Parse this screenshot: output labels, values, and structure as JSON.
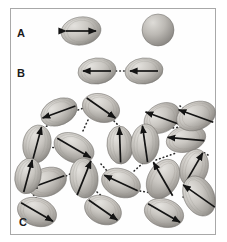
{
  "figure": {
    "type": "scientific-diagram",
    "background_color": "#ffffff",
    "frame_color": "#a8a8a8",
    "particle_fill_light": "#d8d6d2",
    "particle_fill_mid": "#b8b5b0",
    "particle_fill_dark": "#8e8b86",
    "arrow_color": "#1a1a1a",
    "dotted_link_color": "#2a2a2a"
  },
  "panels": [
    {
      "id": "A",
      "label": "A",
      "label_x": 17,
      "label_y": 28,
      "items": [
        {
          "name": "egg-particle-with-double-arrow",
          "cx": 81,
          "cy": 31,
          "rx": 20,
          "ry": 14,
          "rot": -8,
          "arrow": "double",
          "arrow_angle": 0,
          "arrow_len": 30
        },
        {
          "name": "plain-sphere",
          "cx": 158,
          "cy": 30,
          "r": 16,
          "arrow": "none"
        }
      ]
    },
    {
      "id": "B",
      "label": "B",
      "label_x": 17,
      "label_y": 68,
      "items": [
        {
          "name": "egg-particle-left-arrow-1",
          "cx": 97,
          "cy": 71,
          "rx": 19,
          "ry": 13,
          "rot": -6,
          "arrow": "single-left",
          "arrow_len": 28
        },
        {
          "name": "egg-particle-left-arrow-2",
          "cx": 144,
          "cy": 71,
          "rx": 19,
          "ry": 13,
          "rot": -6,
          "arrow": "single-left",
          "arrow_len": 28
        }
      ],
      "links": [
        {
          "x1": 116,
          "y1": 71,
          "x2": 125,
          "y2": 71,
          "dots": 3
        }
      ]
    },
    {
      "id": "C",
      "label": "C",
      "label_x": 19,
      "label_y": 224,
      "items": [
        {
          "name": "egg-particle",
          "cx": 59,
          "cy": 112,
          "rx": 19,
          "ry": 13,
          "rot": -24,
          "arrow_angle": 160
        },
        {
          "name": "egg-particle",
          "cx": 101,
          "cy": 108,
          "rx": 19,
          "ry": 14,
          "rot": 18,
          "arrow_angle": 35
        },
        {
          "name": "egg-particle",
          "cx": 162,
          "cy": 118,
          "rx": 19,
          "ry": 14,
          "rot": -30,
          "arrow_angle": 200
        },
        {
          "name": "egg-particle",
          "cx": 37,
          "cy": 144,
          "rx": 14,
          "ry": 19,
          "rot": 10,
          "arrow_angle": 285
        },
        {
          "name": "egg-particle",
          "cx": 74,
          "cy": 148,
          "rx": 21,
          "ry": 14,
          "rot": 25,
          "arrow_angle": 30
        },
        {
          "name": "egg-particle",
          "cx": 120,
          "cy": 145,
          "rx": 13,
          "ry": 19,
          "rot": -4,
          "arrow_angle": 268
        },
        {
          "name": "egg-particle",
          "cx": 145,
          "cy": 144,
          "rx": 14,
          "ry": 20,
          "rot": 4,
          "arrow_angle": 262
        },
        {
          "name": "egg-particle",
          "cx": 186,
          "cy": 139,
          "rx": 20,
          "ry": 13,
          "rot": -14,
          "arrow_angle": 185
        },
        {
          "name": "egg-particle",
          "cx": 84,
          "cy": 178,
          "rx": 14,
          "ry": 20,
          "rot": -6,
          "arrow_angle": 292
        },
        {
          "name": "egg-particle",
          "cx": 194,
          "cy": 168,
          "rx": 14,
          "ry": 19,
          "rot": 16,
          "arrow_angle": 300
        },
        {
          "name": "egg-particle",
          "cx": 47,
          "cy": 182,
          "rx": 20,
          "ry": 14,
          "rot": -20,
          "arrow_angle": 160
        },
        {
          "name": "egg-particle",
          "cx": 121,
          "cy": 183,
          "rx": 20,
          "ry": 14,
          "rot": 20,
          "arrow_angle": 205
        },
        {
          "name": "egg-particle",
          "cx": 163,
          "cy": 179,
          "rx": 15,
          "ry": 21,
          "rot": 30,
          "arrow_angle": 240
        },
        {
          "name": "egg-particle",
          "cx": 37,
          "cy": 212,
          "rx": 20,
          "ry": 14,
          "rot": 18,
          "arrow_angle": 30
        },
        {
          "name": "egg-particle",
          "cx": 103,
          "cy": 210,
          "rx": 19,
          "ry": 14,
          "rot": 22,
          "arrow_angle": 35
        },
        {
          "name": "egg-particle",
          "cx": 164,
          "cy": 213,
          "rx": 20,
          "ry": 14,
          "rot": 16,
          "arrow_angle": 30
        },
        {
          "name": "egg-particle",
          "cx": 199,
          "cy": 196,
          "rx": 15,
          "ry": 21,
          "rot": -26,
          "arrow_angle": 215
        },
        {
          "name": "egg-particle",
          "cx": 196,
          "cy": 116,
          "rx": 20,
          "ry": 14,
          "rot": -20,
          "arrow_angle": 200
        },
        {
          "name": "egg-particle",
          "cx": 28,
          "cy": 176,
          "rx": 13,
          "ry": 18,
          "rot": 12,
          "arrow_angle": 285
        }
      ],
      "links": [
        {
          "x1": 78,
          "y1": 110,
          "x2": 84,
          "y2": 108
        },
        {
          "x1": 47,
          "y1": 126,
          "x2": 39,
          "y2": 129
        },
        {
          "x1": 88,
          "y1": 120,
          "x2": 82,
          "y2": 133
        },
        {
          "x1": 114,
          "y1": 121,
          "x2": 122,
          "y2": 129
        },
        {
          "x1": 49,
          "y1": 147,
          "x2": 57,
          "y2": 148
        },
        {
          "x1": 133,
          "y1": 146,
          "x2": 140,
          "y2": 145
        },
        {
          "x1": 154,
          "y1": 131,
          "x2": 160,
          "y2": 126
        },
        {
          "x1": 173,
          "y1": 128,
          "x2": 180,
          "y2": 127
        },
        {
          "x1": 180,
          "y1": 106,
          "x2": 186,
          "y2": 110
        },
        {
          "x1": 143,
          "y1": 163,
          "x2": 133,
          "y2": 172
        },
        {
          "x1": 156,
          "y1": 160,
          "x2": 176,
          "y2": 153
        },
        {
          "x1": 85,
          "y1": 160,
          "x2": 83,
          "y2": 162
        },
        {
          "x1": 70,
          "y1": 174,
          "x2": 62,
          "y2": 178
        },
        {
          "x1": 33,
          "y1": 161,
          "x2": 31,
          "y2": 164
        },
        {
          "x1": 31,
          "y1": 192,
          "x2": 37,
          "y2": 199
        },
        {
          "x1": 97,
          "y1": 192,
          "x2": 104,
          "y2": 198
        },
        {
          "x1": 112,
          "y1": 173,
          "x2": 116,
          "y2": 170
        },
        {
          "x1": 140,
          "y1": 191,
          "x2": 152,
          "y2": 193
        },
        {
          "x1": 183,
          "y1": 197,
          "x2": 190,
          "y2": 198
        },
        {
          "x1": 196,
          "y1": 182,
          "x2": 198,
          "y2": 178
        },
        {
          "x1": 208,
          "y1": 155,
          "x2": 203,
          "y2": 152
        },
        {
          "x1": 101,
          "y1": 164,
          "x2": 108,
          "y2": 172
        }
      ]
    }
  ]
}
